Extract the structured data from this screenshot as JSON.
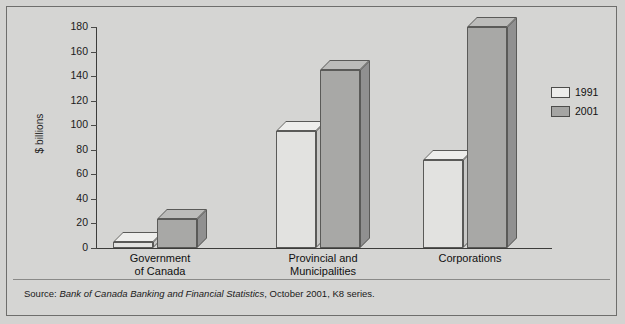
{
  "chart_data": {
    "type": "bar",
    "title": "",
    "subtitle": "",
    "xlabel": "",
    "ylabel": "$ billions",
    "ylim": [
      0,
      180
    ],
    "yticks": [
      0,
      20,
      40,
      60,
      80,
      100,
      120,
      140,
      160,
      180
    ],
    "grid": false,
    "legend_position": "right",
    "categories": [
      "Government of Canada",
      "Provincial and Municipalities",
      "Corporations"
    ],
    "category_lines": [
      [
        "Government",
        "of Canada"
      ],
      [
        "Provincial and",
        "Municipalities"
      ],
      [
        "Corporations"
      ]
    ],
    "series": [
      {
        "name": "1991",
        "color": "#e2e2e0",
        "values": [
          5,
          95,
          72
        ]
      },
      {
        "name": "2001",
        "color": "#a8a8a6",
        "values": [
          24,
          145,
          180
        ]
      }
    ],
    "annotations": []
  },
  "source": {
    "prefix": "Source: ",
    "italic": "Bank of Canada Banking and Financial Statistics",
    "suffix": ", October 2001, K8 series."
  },
  "legend": {
    "items": [
      {
        "label": "1991",
        "swatch": "light"
      },
      {
        "label": "2001",
        "swatch": "dark"
      }
    ]
  }
}
